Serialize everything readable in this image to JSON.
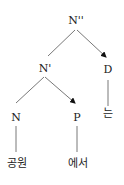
{
  "diagram": {
    "type": "syntax-tree",
    "colors": {
      "line": "#555555",
      "text": "#222222",
      "background": "#ffffff"
    },
    "nodes": {
      "root": {
        "label": "N''"
      },
      "nbar": {
        "label": "N'"
      },
      "d": {
        "label": "D"
      },
      "n": {
        "label": "N"
      },
      "p": {
        "label": "P"
      }
    },
    "leaves": {
      "n_word": "공원",
      "p_word": "에서",
      "d_word": "는"
    },
    "edges": [
      {
        "from": "N''",
        "to": "N'",
        "style": "line"
      },
      {
        "from": "N''",
        "to": "D",
        "style": "arrow"
      },
      {
        "from": "N'",
        "to": "N",
        "style": "line"
      },
      {
        "from": "N'",
        "to": "P",
        "style": "arrow"
      },
      {
        "from": "N",
        "to": "공원",
        "style": "line"
      },
      {
        "from": "P",
        "to": "에서",
        "style": "line"
      },
      {
        "from": "D",
        "to": "는",
        "style": "line"
      }
    ]
  }
}
